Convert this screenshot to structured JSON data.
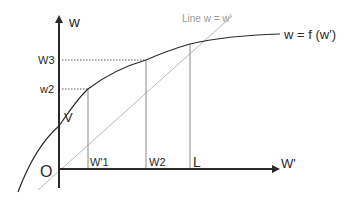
{
  "diagram": {
    "axes": {
      "y_label": "w",
      "x_label": "W'",
      "origin_label": "O"
    },
    "curve": {
      "label": "w = f (w')",
      "color": "#2a2a2a"
    },
    "diagonal": {
      "label": "Line w = w'",
      "color": "#b8b8b8"
    },
    "y_ticks": [
      {
        "label": "W3"
      },
      {
        "label": "w2"
      }
    ],
    "intercept_label": "V",
    "x_ticks": [
      {
        "label": "W'1"
      },
      {
        "label": "W2"
      },
      {
        "label": "L"
      }
    ],
    "colors": {
      "axis": "#2a2a2a",
      "guide": "#8a8a8a",
      "dotted": "#555555"
    }
  }
}
